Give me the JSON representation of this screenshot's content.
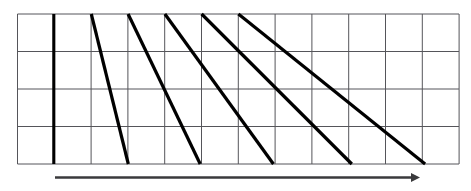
{
  "figure": {
    "background_color": "#ffffff",
    "width": 471,
    "height": 191
  },
  "grid": {
    "name": "rectangular-grid",
    "left": 17.5,
    "top": 14,
    "right": 459,
    "bottom": 164,
    "columns": 12,
    "rows": 4,
    "column_width": 36.79,
    "row_height": 37.5,
    "line_color": "#55555a",
    "line_width": 1,
    "x_ticks": [
      17.5,
      54.3,
      91.1,
      127.9,
      164.7,
      201.5,
      238.3,
      275.1,
      311.9,
      348.7,
      385.5,
      422.3,
      459.1
    ],
    "y_ticks": [
      14,
      51.5,
      89,
      126.5,
      164
    ]
  },
  "marker_line": {
    "name": "thick-vertical-marker",
    "x": 53.8,
    "y1": 14,
    "y2": 164,
    "color": "#000000",
    "line_width": 3.1
  },
  "diagonals": {
    "name": "sawtooth-ramp-lines",
    "color": "#000000",
    "line_width": 3.2,
    "count": 5,
    "segments": [
      {
        "label": "ramp-1",
        "x1": 91.3,
        "y1": 14,
        "x2": 128.3,
        "y2": 164,
        "columns_spanned": 1
      },
      {
        "label": "ramp-2",
        "x1": 128.1,
        "y1": 14,
        "x2": 200.2,
        "y2": 164,
        "columns_spanned": 2
      },
      {
        "label": "ramp-3",
        "x1": 164.9,
        "y1": 14,
        "x2": 273.4,
        "y2": 164,
        "columns_spanned": 3
      },
      {
        "label": "ramp-4",
        "x1": 201.6,
        "y1": 14,
        "x2": 351.8,
        "y2": 164,
        "columns_spanned": 4
      },
      {
        "label": "ramp-5",
        "x1": 238.4,
        "y1": 14,
        "x2": 425.1,
        "y2": 164,
        "columns_spanned": 5
      }
    ]
  },
  "axis_arrow": {
    "name": "horizontal-time-arrow",
    "x1": 55,
    "x2": 420,
    "y": 177.5,
    "color": "#3a3a3c",
    "line_width": 2.6,
    "head_length": 9,
    "head_width": 9,
    "label": ""
  }
}
